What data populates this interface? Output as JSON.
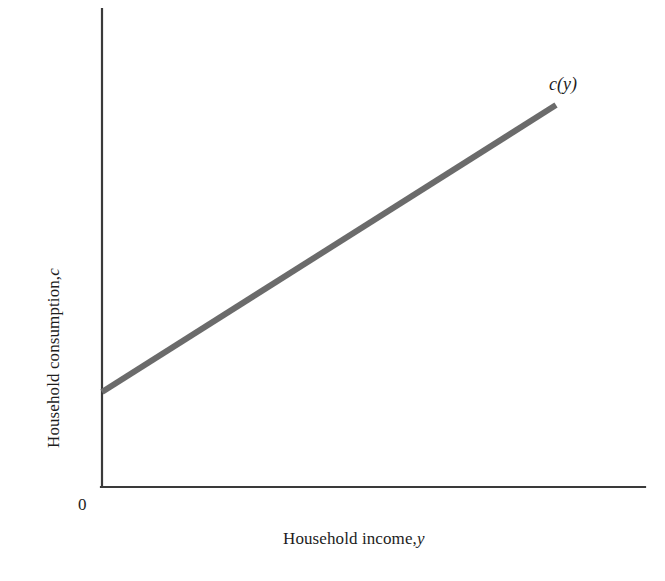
{
  "figure": {
    "background_color": "#ffffff",
    "origin_label": "0",
    "curve_label": "c(y)",
    "x_axis_label_main": "Household income,",
    "x_axis_label_var": "y",
    "y_axis_label_main": "Household consumption,",
    "y_axis_label_var": "c",
    "axis_color": "#3a3a3a",
    "line_color": "#6b6b6b"
  },
  "chart_data": {
    "type": "line",
    "title": "",
    "xlabel": "Household income, y",
    "ylabel": "Household consumption, c",
    "xlim": [
      0,
      1
    ],
    "ylim": [
      0,
      1
    ],
    "grid": false,
    "legend": "none",
    "annotations": [
      {
        "text": "c(y)",
        "x": 0.86,
        "y": 0.83,
        "note": "curve label at upper-right end of line"
      },
      {
        "text": "0",
        "x": 0.0,
        "y": 0.0,
        "note": "origin label below-left of axis corner"
      }
    ],
    "series": [
      {
        "name": "c(y)",
        "color": "#6b6b6b",
        "linewidth": 6,
        "note": "Linear consumption function with positive intercept (autonomous consumption) and slope less than 1 (marginal propensity to consume)",
        "x": [
          0.0,
          1.0
        ],
        "y": [
          0.198,
          0.798
        ],
        "intercept": 0.198,
        "slope": 0.6,
        "points_px": [
          {
            "x": 102,
            "y": 392
          },
          {
            "x": 556,
            "y": 105
          }
        ]
      }
    ],
    "axes_px": {
      "x_axis": {
        "x1": 102,
        "y1": 487,
        "x2": 645,
        "y2": 487
      },
      "y_axis": {
        "x1": 102,
        "y1": 9,
        "x2": 102,
        "y2": 487
      }
    }
  }
}
